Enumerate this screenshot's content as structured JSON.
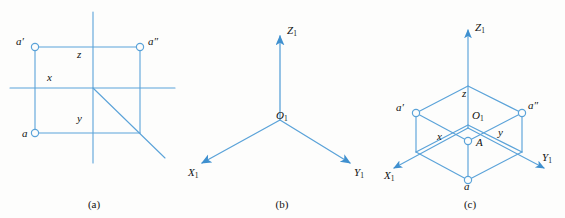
{
  "figure": {
    "line_color": "#5ba3d9",
    "label_color": "#111111",
    "background": "#fdfdfc"
  },
  "panels": [
    {
      "id": "a",
      "caption": "(a)",
      "description": "Two-dimensional orthographic projection with horizontal and vertical axes, a rectangle of projection lines, and a 45-degree diagonal miter line.",
      "labels": {
        "a_prime": "a′",
        "a_double_prime": "a″",
        "a": "a",
        "x": "x",
        "y": "y",
        "z": "z"
      }
    },
    {
      "id": "b",
      "caption": "(b)",
      "description": "Three-axis isometric coordinate system with arrowheads on each axis.",
      "labels": {
        "origin": "O",
        "origin_sub": "1",
        "z_axis": "Z",
        "z_axis_sub": "1",
        "x_axis": "X",
        "x_axis_sub": "1",
        "y_axis": "Y",
        "y_axis_sub": "1"
      }
    },
    {
      "id": "c",
      "caption": "(c)",
      "description": "Isometric pictorial of a point A located in space by its coordinate box, with projections a, a-prime and a-double-prime on the three planes.",
      "labels": {
        "origin": "O",
        "origin_sub": "1",
        "z_axis": "Z",
        "z_axis_sub": "1",
        "x_axis": "X",
        "x_axis_sub": "1",
        "y_axis": "Y",
        "y_axis_sub": "1",
        "point_A": "A",
        "a_prime": "a′",
        "a_double_prime": "a″",
        "a": "a",
        "x": "x",
        "y": "y",
        "z": "z"
      }
    }
  ]
}
